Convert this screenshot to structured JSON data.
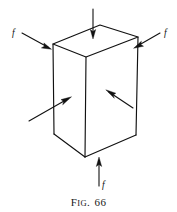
{
  "figure": {
    "caption": {
      "prefix_initial": "F",
      "prefix_rest": "IG",
      "separator": ".",
      "number": "66",
      "full_text": "FIG. 66"
    },
    "colors": {
      "background": "#ffffff",
      "ink": "#111111",
      "face_fill": "#ffffff"
    },
    "solid": {
      "name": "cuboid",
      "vertices": {
        "top_back": [
          100,
          25
        ],
        "top_left": [
          53,
          44
        ],
        "top_right": [
          138,
          37
        ],
        "top_front": [
          86,
          57
        ],
        "bottom_left": [
          54,
          134
        ],
        "bottom_front": [
          85,
          157
        ],
        "bottom_right": [
          136,
          135
        ]
      }
    },
    "forces": [
      {
        "id": "force-top",
        "label": "",
        "direction": "down",
        "tail": [
          93,
          9
        ],
        "tip": [
          93,
          38
        ],
        "label_pos": [
          0,
          0
        ]
      },
      {
        "id": "force-left-upper",
        "label": "f",
        "direction": "down-right",
        "tail": [
          22,
          33
        ],
        "tip": [
          51,
          49
        ],
        "label_pos": [
          12,
          36
        ]
      },
      {
        "id": "force-right-upper",
        "label": "f",
        "direction": "down-left",
        "tail": [
          160,
          33
        ],
        "tip": [
          134,
          48
        ],
        "label_pos": [
          164,
          36
        ]
      },
      {
        "id": "force-left-face",
        "label": "",
        "direction": "up-right",
        "tail": [
          29,
          121
        ],
        "tip": [
          71,
          97
        ],
        "label_pos": [
          0,
          0
        ]
      },
      {
        "id": "force-front-face",
        "label": "",
        "direction": "up-left",
        "tail": [
          133,
          108
        ],
        "tip": [
          106,
          90
        ],
        "label_pos": [
          0,
          0
        ]
      },
      {
        "id": "force-bottom",
        "label": "f",
        "direction": "up",
        "tail": [
          99,
          186
        ],
        "tip": [
          99,
          158
        ],
        "label_pos": [
          102,
          187
        ]
      }
    ]
  }
}
